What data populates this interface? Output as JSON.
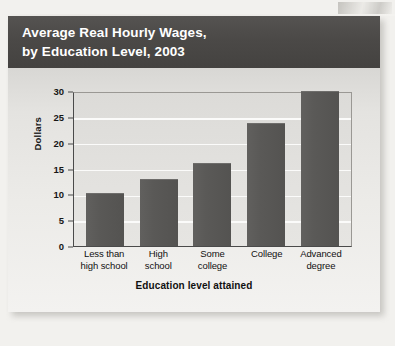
{
  "figure": {
    "title_line_1": "Average Real Hourly Wages,",
    "title_line_2": "by Education Level, 2003"
  },
  "chart_data": {
    "type": "bar",
    "title": "Average Real Hourly Wages, by Education Level, 2003",
    "xlabel": "Education level attained",
    "ylabel": "Dollars",
    "categories": [
      "Less than high school",
      "High school",
      "Some college",
      "College",
      "Advanced degree"
    ],
    "category_lines": [
      [
        "Less than",
        "high school"
      ],
      [
        "High",
        "school"
      ],
      [
        "Some",
        "college"
      ],
      [
        "College",
        ""
      ],
      [
        "Advanced",
        "degree"
      ]
    ],
    "values": [
      10.3,
      13.0,
      16.0,
      23.8,
      30.0
    ],
    "ylim": [
      0,
      30
    ],
    "yticks": [
      0,
      5,
      10,
      15,
      20,
      25,
      30
    ],
    "ytick_labels": [
      "0",
      "5",
      "10",
      "15",
      "20",
      "25",
      "30"
    ],
    "grid": true,
    "legend": "none",
    "bar_color": "#5a5957",
    "plot_background": "#e2e1de",
    "gridline_color": "#fbfbfa",
    "title_bar_color": "#4b4947",
    "title_text_color": "#ffffff"
  }
}
